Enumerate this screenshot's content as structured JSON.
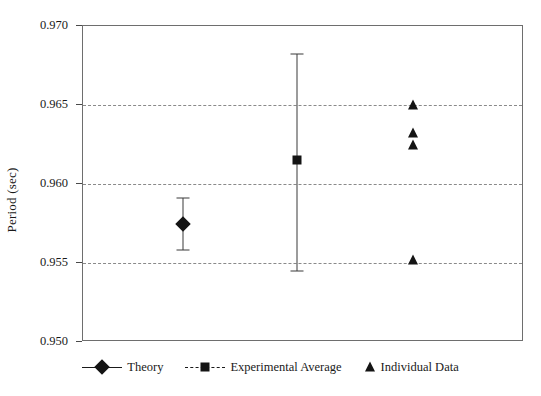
{
  "chart_data": {
    "type": "scatter",
    "title": "",
    "xlabel": "",
    "ylabel": "Period (sec)",
    "ylim": [
      0.95,
      0.97
    ],
    "yticks": [
      "0.970",
      "0.965",
      "0.960",
      "0.955",
      "0.950"
    ],
    "ytick_values": [
      0.97,
      0.965,
      0.96,
      0.955,
      0.95
    ],
    "grid": "horizontal-dashed",
    "gridline_values": [
      0.965,
      0.96,
      0.955
    ],
    "xaxis_visible_labels": false,
    "legend_position": "bottom-center",
    "series": [
      {
        "name": "Theory",
        "marker": "diamond",
        "line": "solid",
        "x_position": 0.227,
        "points": [
          {
            "value": 0.9575,
            "error_high": 0.9591,
            "error_low": 0.9558,
            "error_plus": 0.0016,
            "error_minus": 0.0017
          }
        ]
      },
      {
        "name": "Experimental Average",
        "marker": "square",
        "line": "dashed",
        "x_position": 0.485,
        "points": [
          {
            "value": 0.9615,
            "error_high": 0.9682,
            "error_low": 0.9545,
            "error_plus": 0.0067,
            "error_minus": 0.007
          }
        ]
      },
      {
        "name": "Individual Data",
        "marker": "triangle",
        "line": "none",
        "x_position": 0.748,
        "values": [
          0.965,
          0.9632,
          0.9625,
          0.9552
        ]
      }
    ]
  },
  "legend": {
    "entries": [
      {
        "label": "Theory",
        "marker": "diamond-marker",
        "line_style": "solid"
      },
      {
        "label": "Experimental Average",
        "marker": "square-marker",
        "line_style": "dashed"
      },
      {
        "label": "Individual Data",
        "marker": "triangle-marker",
        "line_style": "none"
      }
    ]
  },
  "colors": {
    "marker": "#141414",
    "axis": "#6e6e6e",
    "gridline": "#8a8a8a",
    "background": "#ffffff"
  }
}
